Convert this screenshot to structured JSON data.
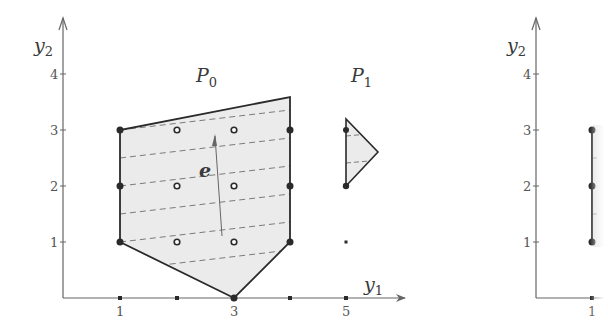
{
  "left_plot": {
    "x_axis_label": "y",
    "x_axis_sub": "1",
    "y_axis_label": "y",
    "y_axis_sub": "2",
    "x_ticks": [
      "1",
      "3",
      "5"
    ],
    "y_ticks": [
      "1",
      "2",
      "3",
      "4"
    ],
    "polytopes": [
      {
        "name": "P",
        "sub": "0",
        "vertices": [
          [
            1,
            3
          ],
          [
            4,
            3.5
          ],
          [
            4,
            1
          ],
          [
            3,
            0
          ],
          [
            1,
            1
          ]
        ]
      },
      {
        "name": "P",
        "sub": "1",
        "vertices": [
          [
            5,
            3.2
          ],
          [
            5.6,
            2.6
          ],
          [
            5,
            2
          ]
        ]
      }
    ],
    "vector_label": "e",
    "lattice_points_filled": [
      [
        1,
        1
      ],
      [
        1,
        2
      ],
      [
        1,
        3
      ],
      [
        4,
        1
      ],
      [
        4,
        2
      ],
      [
        4,
        3
      ],
      [
        3,
        0
      ],
      [
        5,
        2
      ]
    ],
    "lattice_points_open": [
      [
        2,
        1
      ],
      [
        2,
        2
      ],
      [
        2,
        3
      ],
      [
        3,
        1
      ],
      [
        3,
        2
      ],
      [
        3,
        3
      ]
    ],
    "colors": {
      "fill": "#ebebeb",
      "stroke": "#2a2a2a",
      "axis": "#666666",
      "dash": "#7a7a7a"
    }
  },
  "right_plot": {
    "y_axis_label": "y",
    "y_axis_sub": "2",
    "x_ticks": [
      "1"
    ],
    "y_ticks": [
      "1",
      "2",
      "3",
      "4"
    ],
    "segment": [
      [
        1,
        1
      ],
      [
        1,
        3
      ]
    ]
  }
}
